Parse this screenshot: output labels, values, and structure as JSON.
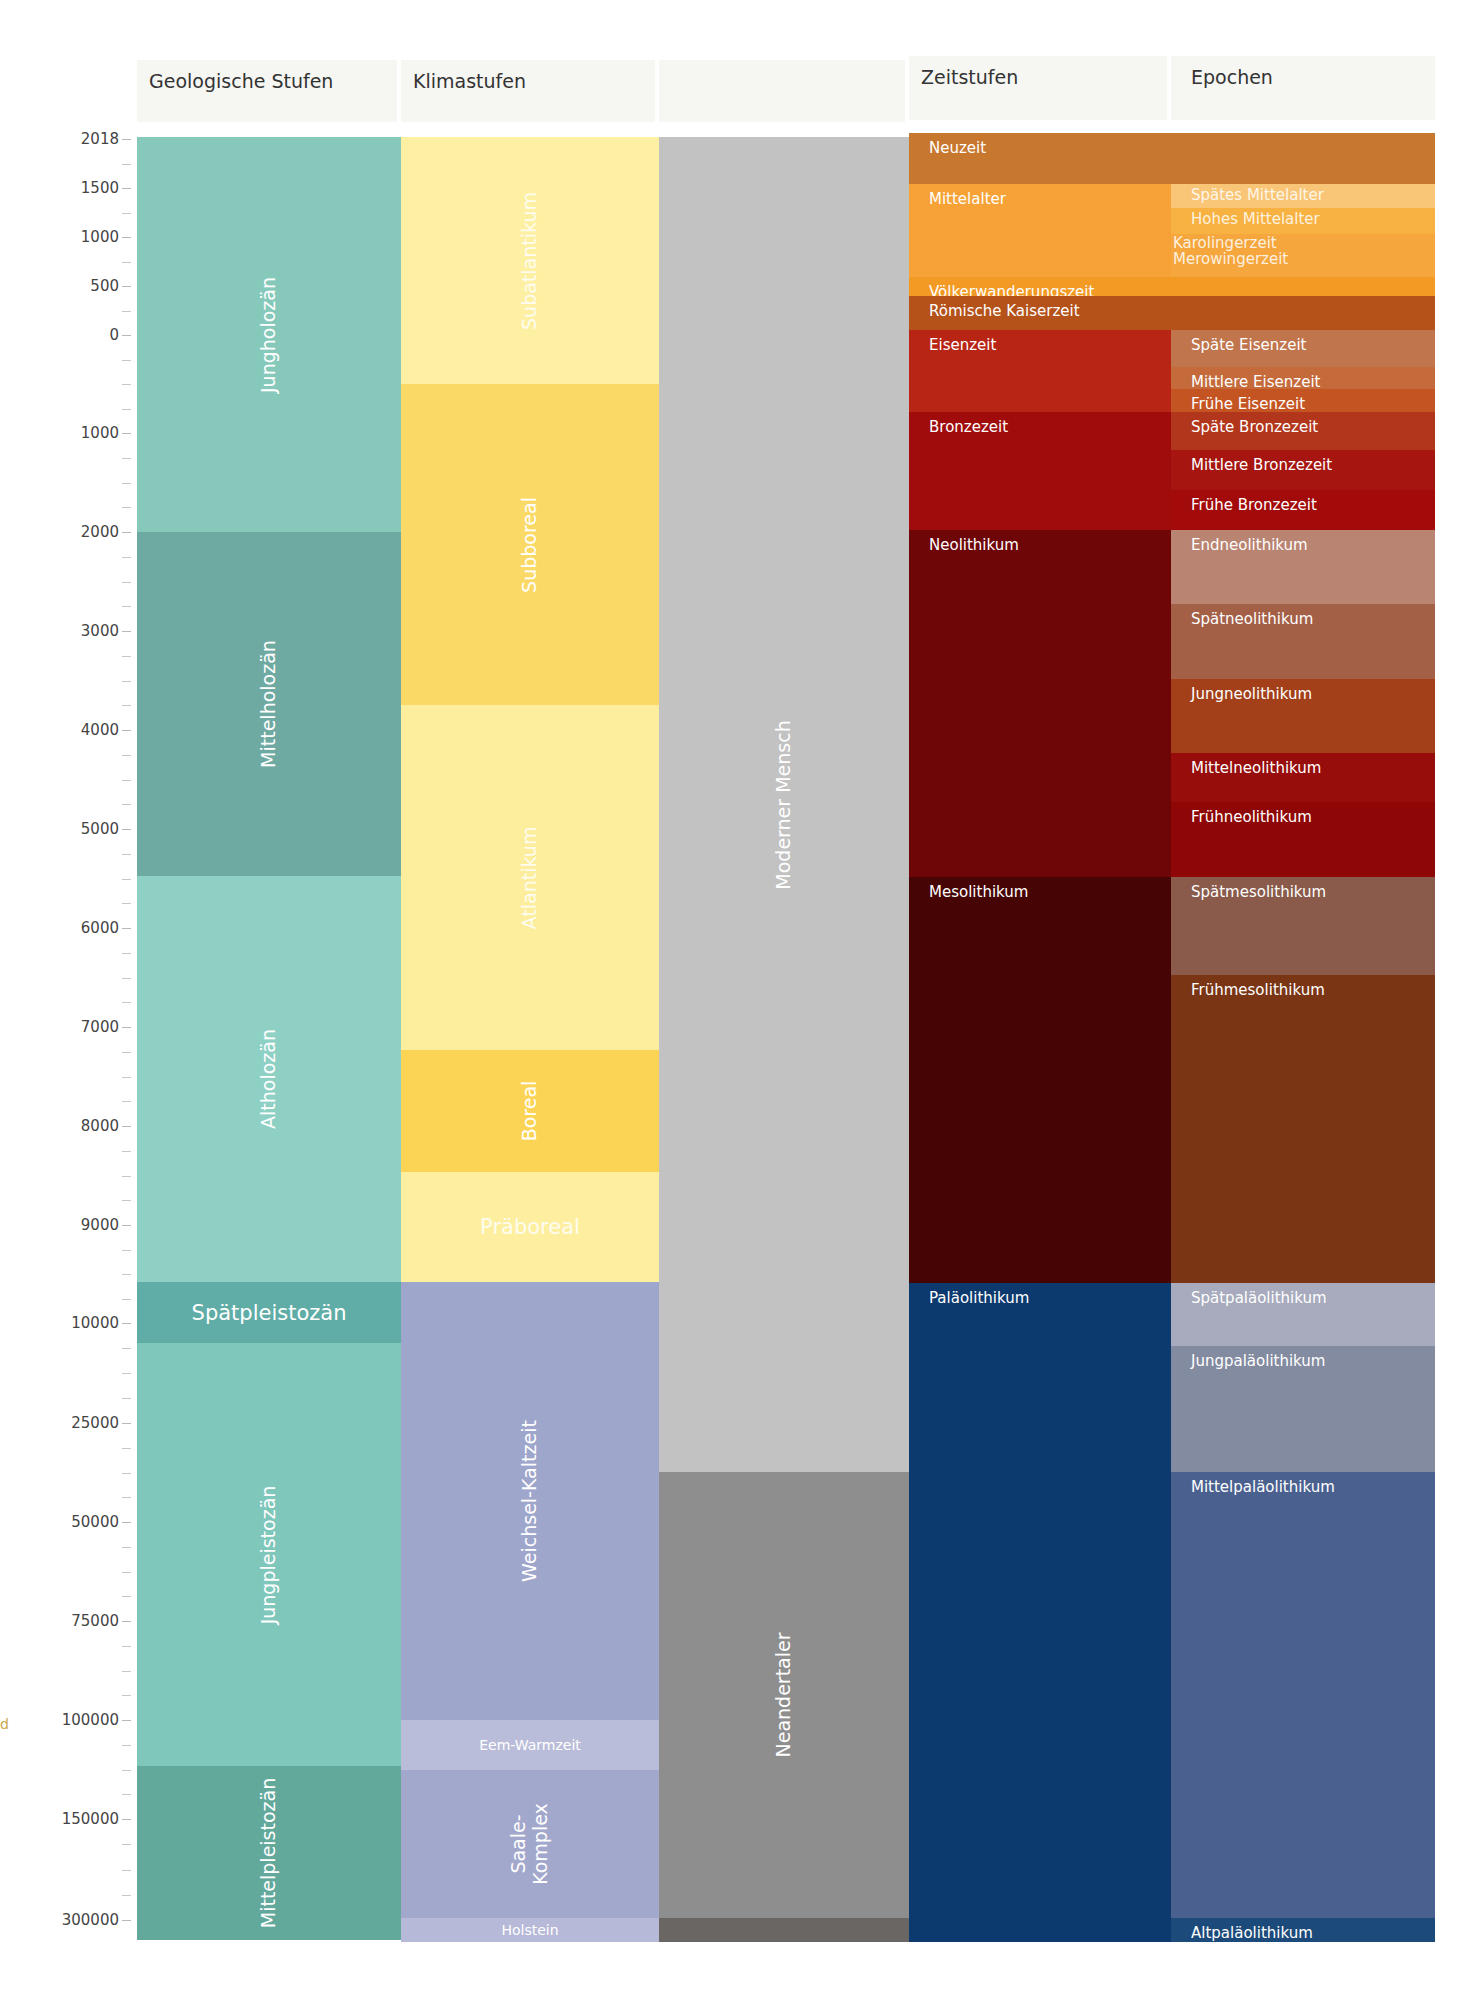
{
  "chart_data": {
    "type": "table",
    "title": "",
    "columns": [
      "Geologische Stufen",
      "Klimastufen",
      "",
      "Zeitstufen",
      "Epochen"
    ],
    "y_axis": {
      "ticks": [
        "2018",
        "1500",
        "1000",
        "500",
        "0",
        "1000",
        "2000",
        "3000",
        "4000",
        "5000",
        "6000",
        "7000",
        "8000",
        "9000",
        "10000",
        "25000",
        "50000",
        "75000",
        "100000",
        "150000",
        "300000"
      ],
      "tick_y_px": [
        139,
        188,
        237,
        286,
        335,
        433,
        532,
        631,
        730,
        829,
        928,
        1027,
        1126,
        1225,
        1323,
        1423,
        1522,
        1621,
        1720,
        1819,
        1920
      ]
    }
  },
  "headers": {
    "geologische_stufen": "Geologische Stufen",
    "klimastufen": "Klimastufen",
    "menschen": "",
    "zeitstufen": "Zeitstufen",
    "epochen": "Epochen"
  },
  "axis": {
    "labels": [
      {
        "text": "2018",
        "y": 139
      },
      {
        "text": "1500",
        "y": 188
      },
      {
        "text": "1000",
        "y": 237
      },
      {
        "text": "500",
        "y": 286
      },
      {
        "text": "0",
        "y": 335
      },
      {
        "text": "1000",
        "y": 433
      },
      {
        "text": "2000",
        "y": 532
      },
      {
        "text": "3000",
        "y": 631
      },
      {
        "text": "4000",
        "y": 730
      },
      {
        "text": "5000",
        "y": 829
      },
      {
        "text": "6000",
        "y": 928
      },
      {
        "text": "7000",
        "y": 1027
      },
      {
        "text": "8000",
        "y": 1126
      },
      {
        "text": "9000",
        "y": 1225
      },
      {
        "text": "10000",
        "y": 1323
      },
      {
        "text": "25000",
        "y": 1423
      },
      {
        "text": "50000",
        "y": 1522
      },
      {
        "text": "75000",
        "y": 1621
      },
      {
        "text": "100000",
        "y": 1720
      },
      {
        "text": "150000",
        "y": 1819
      },
      {
        "text": "300000",
        "y": 1920
      }
    ]
  },
  "geologische_stufen": [
    {
      "label": "Jungholozän",
      "top": 137,
      "bottom": 532,
      "color": "#86c9bb",
      "style": "vert"
    },
    {
      "label": "Mittelholozän",
      "top": 532,
      "bottom": 876,
      "color": "#6faaa2",
      "style": "vert"
    },
    {
      "label": "Altholozän",
      "top": 876,
      "bottom": 1282,
      "color": "#8fd0c5",
      "style": "vert"
    },
    {
      "label": "Spätpleistozän",
      "top": 1282,
      "bottom": 1343,
      "color": "#5fada6",
      "style": "big"
    },
    {
      "label": "Jungpleistozän",
      "top": 1343,
      "bottom": 1766,
      "color": "#7fc6bb",
      "style": "vert"
    },
    {
      "label": "Mittelpleistozän",
      "top": 1766,
      "bottom": 1940,
      "color": "#62a99c",
      "style": "vert"
    }
  ],
  "klimastufen": [
    {
      "label": "Subatlantikum",
      "top": 137,
      "bottom": 384,
      "color": "#fdf0a2",
      "style": "vert faint"
    },
    {
      "label": "Subboreal",
      "top": 384,
      "bottom": 705,
      "color": "#fbd966",
      "style": "vert"
    },
    {
      "label": "Atlantikum",
      "top": 705,
      "bottom": 1050,
      "color": "#fdee9e",
      "style": "vert faint"
    },
    {
      "label": "Boreal",
      "top": 1050,
      "bottom": 1172,
      "color": "#fcd455",
      "style": "vert"
    },
    {
      "label": "Präboreal",
      "top": 1172,
      "bottom": 1282,
      "color": "#fdef9f",
      "style": "big faint"
    },
    {
      "label": "Weichsel-Kaltzeit",
      "top": 1282,
      "bottom": 1720,
      "color": "#9fa6cb",
      "style": "vert"
    },
    {
      "label": "Eem-Warmzeit",
      "top": 1720,
      "bottom": 1770,
      "color": "#babdd9",
      "style": "sm"
    },
    {
      "label": "Saale-\nKomplex",
      "top": 1770,
      "bottom": 1918,
      "color": "#a2a7cc",
      "style": "vert two"
    },
    {
      "label": "Holstein",
      "top": 1918,
      "bottom": 1942,
      "color": "#b6b9d7",
      "style": "sm"
    }
  ],
  "menschen": [
    {
      "label": "Moderner Mensch",
      "top": 137,
      "bottom": 1472,
      "color": "#c2c2c2",
      "style": "vert"
    },
    {
      "label": "Neandertaler",
      "top": 1472,
      "bottom": 1918,
      "color": "#8e8e8e",
      "style": "vert"
    },
    {
      "label": "",
      "top": 1918,
      "bottom": 1942,
      "color": "#6a6663",
      "style": ""
    }
  ],
  "zeitstufen": [
    {
      "label": "Neuzeit",
      "top": 133,
      "bottom": 184,
      "color": "#c8772e"
    },
    {
      "label": "Mittelalter",
      "top": 184,
      "bottom": 277,
      "color": "#f6a236"
    },
    {
      "label": "Völkerwanderungszeit",
      "top": 277,
      "bottom": 296,
      "color": "#f29a24"
    },
    {
      "label": "Römische Kaiserzeit",
      "top": 296,
      "bottom": 330,
      "color": "#b4521a"
    },
    {
      "label": "Eisenzeit",
      "top": 330,
      "bottom": 412,
      "color": "#b82515"
    },
    {
      "label": "Bronzezeit",
      "top": 412,
      "bottom": 530,
      "color": "#a00c0c"
    },
    {
      "label": "Neolithikum",
      "top": 530,
      "bottom": 877,
      "color": "#6e0608"
    },
    {
      "label": "Mesolithikum",
      "top": 877,
      "bottom": 1283,
      "color": "#470405"
    },
    {
      "label": "Paläolithikum",
      "top": 1283,
      "bottom": 1942,
      "color": "#0d3a6e"
    }
  ],
  "epochen": [
    {
      "label": "Spätes Mittelalter",
      "top": 184,
      "bottom": 208,
      "color": "#f9c677",
      "faint": true
    },
    {
      "label": "Hohes Mittelalter",
      "top": 208,
      "bottom": 234,
      "color": "#f7b242",
      "faint": true
    },
    {
      "label": "Karolingerzeit\nMerowingerzeit",
      "top": 234,
      "bottom": 277,
      "color": "#f5a63d",
      "faint": true
    },
    {
      "label": "",
      "top": 277,
      "bottom": 296,
      "color": "#f29a24"
    },
    {
      "label": "",
      "top": 296,
      "bottom": 330,
      "color": "#b4521a"
    },
    {
      "label": "Späte Eisenzeit",
      "top": 330,
      "bottom": 367,
      "color": "#c0754c"
    },
    {
      "label": "Mittlere Eisenzeit",
      "top": 367,
      "bottom": 389,
      "color": "#c56a3a"
    },
    {
      "label": "Frühe Eisenzeit",
      "top": 389,
      "bottom": 412,
      "color": "#c45523"
    },
    {
      "label": "Späte Bronzezeit",
      "top": 412,
      "bottom": 450,
      "color": "#b2361b"
    },
    {
      "label": "Mittlere Bronzezeit",
      "top": 450,
      "bottom": 490,
      "color": "#a6150f"
    },
    {
      "label": "Frühe Bronzezeit",
      "top": 490,
      "bottom": 530,
      "color": "#a30a0a"
    },
    {
      "label": "Endneolithikum",
      "top": 530,
      "bottom": 604,
      "color": "#b98472"
    },
    {
      "label": "Spätneolithikum",
      "top": 604,
      "bottom": 679,
      "color": "#a46047"
    },
    {
      "label": "Jungneolithikum",
      "top": 679,
      "bottom": 753,
      "color": "#a3401a"
    },
    {
      "label": "Mittelneolithikum",
      "top": 753,
      "bottom": 802,
      "color": "#960d0b"
    },
    {
      "label": "Frühneolithikum",
      "top": 802,
      "bottom": 877,
      "color": "#8e0606"
    },
    {
      "label": "Spätmesolithikum",
      "top": 877,
      "bottom": 975,
      "color": "#8a5a4a"
    },
    {
      "label": "Frühmesolithikum",
      "top": 975,
      "bottom": 1283,
      "color": "#7a3515"
    },
    {
      "label": "Spätpaläolithikum",
      "top": 1283,
      "bottom": 1346,
      "color": "#a7abbd"
    },
    {
      "label": "Jungpaläolithikum",
      "top": 1346,
      "bottom": 1472,
      "color": "#838ba1"
    },
    {
      "label": "Mittelpaläolithikum",
      "top": 1472,
      "bottom": 1918,
      "color": "#4a6190"
    },
    {
      "label": "Altpaläolithikum",
      "top": 1918,
      "bottom": 1942,
      "color": "#1c4a7a"
    }
  ],
  "stray_mark": "d"
}
